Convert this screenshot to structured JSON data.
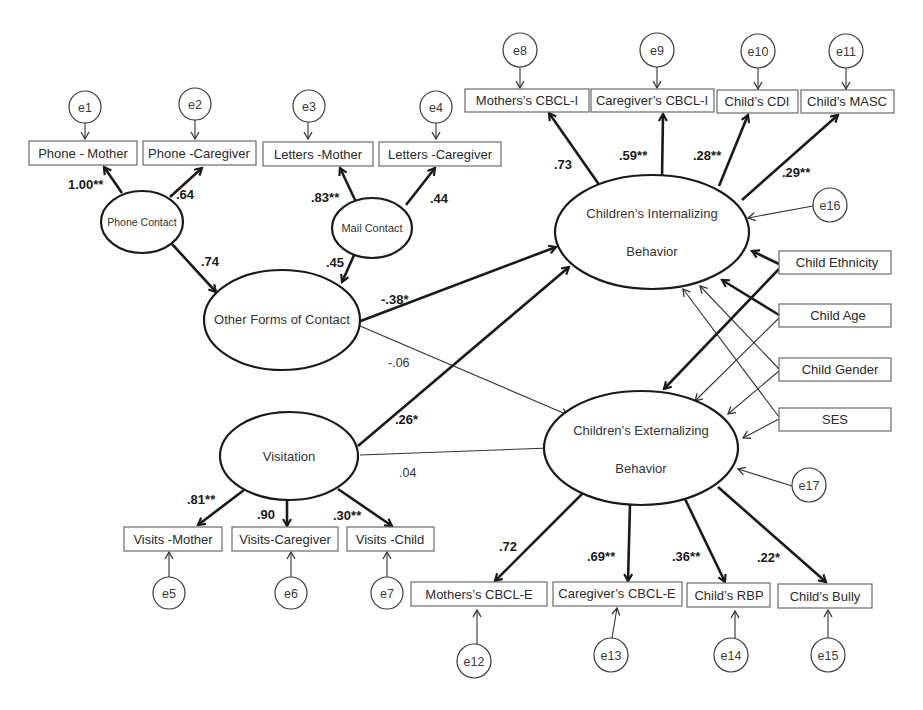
{
  "diagram": {
    "type": "structural equation model",
    "latent_variables": {
      "phone_contact": "Phone Contact",
      "mail_contact": "Mail Contact",
      "other_forms": "Other Forms of Contact",
      "visitation": "Visitation",
      "internalizing_line1": "Children’s Internalizing",
      "internalizing_line2": "Behavior",
      "externalizing_line1": "Children’s Externalizing",
      "externalizing_line2": "Behavior"
    },
    "observed": {
      "phone_mother": "Phone - Mother",
      "phone_caregiver": "Phone -Caregiver",
      "letters_mother": "Letters -Mother",
      "letters_caregiver": "Letters -Caregiver",
      "visits_mother": "Visits -Mother",
      "visits_caregiver": "Visits-Caregiver",
      "visits_child": "Visits -Child",
      "mothers_cbcl_i": "Mothers’s CBCL-I",
      "caregivers_cbcl_i": "Caregiver’s CBCL-I",
      "childs_cdi": "Child’s CDI",
      "childs_masc": "Child’s MASC",
      "mothers_cbcl_e": "Mothers’s CBCL-E",
      "caregivers_cbcl_e": "Caregiver’s CBCL-E",
      "childs_rbp": "Child’s RBP",
      "childs_bully": "Child’s Bully",
      "child_ethnicity": "Child Ethnicity",
      "child_age": "Child Age",
      "child_gender": "Child Gender",
      "ses": "SES"
    },
    "errors": {
      "e1": "e1",
      "e2": "e2",
      "e3": "e3",
      "e4": "e4",
      "e5": "e5",
      "e6": "e6",
      "e7": "e7",
      "e8": "e8",
      "e9": "e9",
      "e10": "e10",
      "e11": "e11",
      "e12": "e12",
      "e13": "e13",
      "e14": "e14",
      "e15": "e15",
      "e16": "e16",
      "e17": "e17"
    },
    "coefficients": {
      "phone_mother": "1.00**",
      "phone_caregiver": ".64",
      "letters_mother": ".83**",
      "letters_caregiver": ".44",
      "phone_to_other": ".74",
      "mail_to_other": ".45",
      "other_to_int": "-.38*",
      "other_to_ext": "-.06",
      "visit_to_int": ".26*",
      "visit_to_ext": ".04",
      "visits_mother": ".81**",
      "visits_caregiver": ".90",
      "visits_child": ".30**",
      "mothers_cbcl_i": ".73",
      "caregivers_cbcl_i": ".59**",
      "childs_cdi": ".28**",
      "childs_masc": ".29**",
      "mothers_cbcl_e": ".72",
      "caregivers_cbcl_e": ".69**",
      "childs_rbp": ".36**",
      "childs_bully": ".22*"
    }
  }
}
